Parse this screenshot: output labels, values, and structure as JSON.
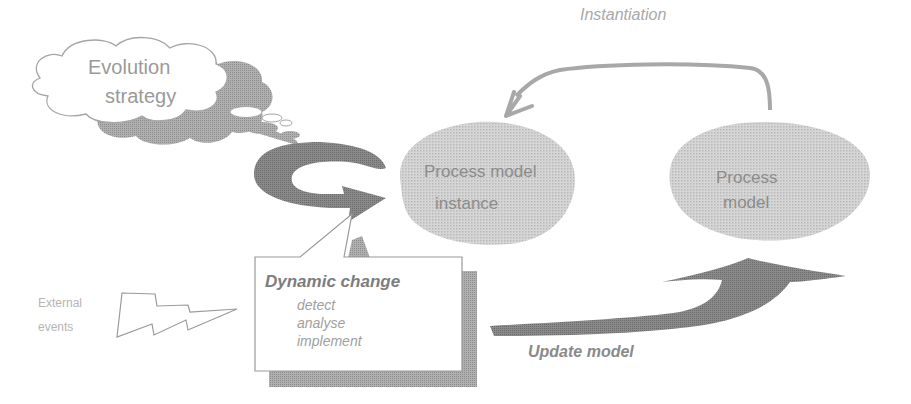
{
  "diagram": {
    "type": "process evolution diagram",
    "colors": {
      "dark_arrow": "#7a7a7a",
      "blob_fill": "#cfcfcf",
      "text_gray": "#8a8a8a",
      "outline": "#9a9a9a",
      "shadow": "#9d9d9d"
    },
    "nodes": {
      "cloud": {
        "line1": "Evolution",
        "line2": "strategy"
      },
      "instance": {
        "line1": "Process model",
        "line2": "instance"
      },
      "model": {
        "line1": "Process",
        "line2": "model"
      },
      "dynamic_change": {
        "title": "Dynamic change",
        "steps": [
          "detect",
          "analyse",
          "implement"
        ]
      },
      "external_events": {
        "line1": "External",
        "line2": "events"
      }
    },
    "edges": {
      "instantiation": {
        "label": "Instantiation",
        "from": "Process model",
        "to": "Process model instance"
      },
      "update_model": {
        "label": "Update model",
        "from": "Dynamic change",
        "to": "Process model"
      },
      "cycle": {
        "label": "",
        "around": "Process model instance"
      },
      "lightning": {
        "from": "External events",
        "to": "Dynamic change"
      }
    }
  }
}
